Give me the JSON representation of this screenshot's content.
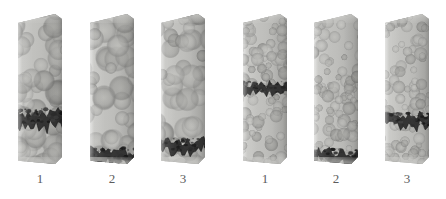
{
  "figure": {
    "type": "scientific-visualization",
    "background_color": "#ffffff",
    "width": 446,
    "height": 199,
    "particle_color": "#a8a8a5",
    "container_color": "#c6c6c3",
    "band_color": "#2b2b2b",
    "label_color": "#5c5c5c"
  },
  "groups": [
    {
      "name": "left-group",
      "particle_scale": "coarse",
      "columns": [
        {
          "label": "1",
          "x": 18,
          "y": 14,
          "width": 44,
          "height": 150,
          "band_center_pct": 66,
          "band_thickness_pct": 12,
          "band_tilt": -4,
          "seed": 11
        },
        {
          "label": "2",
          "x": 90,
          "y": 14,
          "width": 44,
          "height": 150,
          "band_center_pct": 92,
          "band_thickness_pct": 11,
          "band_tilt": 3,
          "seed": 27
        },
        {
          "label": "3",
          "x": 161,
          "y": 14,
          "width": 44,
          "height": 150,
          "band_center_pct": 85,
          "band_thickness_pct": 10,
          "band_tilt": -1,
          "seed": 43
        }
      ]
    },
    {
      "name": "right-group",
      "particle_scale": "fine",
      "columns": [
        {
          "label": "1",
          "x": 243,
          "y": 14,
          "width": 44,
          "height": 150,
          "band_center_pct": 47,
          "band_thickness_pct": 8,
          "band_tilt": -5,
          "seed": 59
        },
        {
          "label": "2",
          "x": 314,
          "y": 14,
          "width": 44,
          "height": 150,
          "band_center_pct": 92,
          "band_thickness_pct": 10,
          "band_tilt": 2,
          "seed": 71
        },
        {
          "label": "3",
          "x": 385,
          "y": 14,
          "width": 44,
          "height": 150,
          "band_center_pct": 68,
          "band_thickness_pct": 10,
          "band_tilt": -3,
          "seed": 89
        }
      ]
    }
  ],
  "labels": {
    "row_y": 172,
    "font_size_px": 13,
    "values": [
      "1",
      "2",
      "3",
      "1",
      "2",
      "3"
    ]
  }
}
